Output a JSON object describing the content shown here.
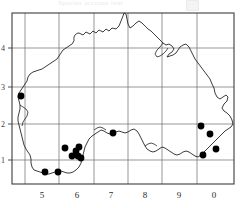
{
  "header": {
    "faint_title": "Species account  text",
    "badge_label": ""
  },
  "map": {
    "title": "Distribution map",
    "frame": {
      "left": 12,
      "top": 13,
      "right": 234,
      "bottom": 184
    },
    "colors": {
      "frame": "#3c3c3c",
      "gridline": "#6a6a6a",
      "coastline": "#1a1a1a",
      "record_dot": "#000000",
      "background": "#ffffff"
    },
    "x_axis": {
      "label": "",
      "ticks": [
        {
          "label": "5",
          "x": 42
        },
        {
          "label": "6",
          "x": 77
        },
        {
          "label": "7",
          "x": 111
        },
        {
          "label": "8",
          "x": 145
        },
        {
          "label": "9",
          "x": 179
        },
        {
          "label": "0",
          "x": 214
        }
      ]
    },
    "y_axis": {
      "label": "",
      "ticks": [
        {
          "label": "4",
          "y": 48
        },
        {
          "label": "3",
          "y": 87
        },
        {
          "label": "2",
          "y": 124
        },
        {
          "label": "1",
          "y": 160
        }
      ]
    },
    "gridlines": {
      "vertical_x": [
        25,
        59,
        94,
        128,
        162,
        197
      ],
      "horizontal_y": [
        48,
        87,
        124,
        160
      ]
    },
    "records": {
      "count": 14,
      "dot_radius": 3.4,
      "points": [
        {
          "x": 21,
          "y": 96
        },
        {
          "x": 113,
          "y": 133
        },
        {
          "x": 65,
          "y": 148
        },
        {
          "x": 79,
          "y": 147
        },
        {
          "x": 72,
          "y": 156
        },
        {
          "x": 78,
          "y": 156
        },
        {
          "x": 81,
          "y": 158
        },
        {
          "x": 45,
          "y": 172
        },
        {
          "x": 58,
          "y": 172
        },
        {
          "x": 201,
          "y": 126
        },
        {
          "x": 210,
          "y": 134
        },
        {
          "x": 216,
          "y": 149
        },
        {
          "x": 203,
          "y": 155
        },
        {
          "x": 76,
          "y": 151
        }
      ]
    }
  }
}
